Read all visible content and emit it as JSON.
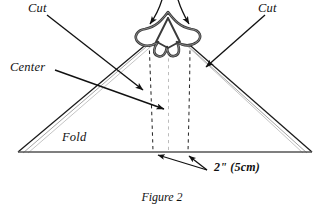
{
  "figure": {
    "caption": "Figure 2",
    "width": 324,
    "height": 204,
    "background_color": "#ffffff",
    "line_color": "#1a1a1a",
    "fold_edge_color": "#9a9a9a",
    "dashed_guide_color": "#2b2b2b",
    "center_guide_color": "#b9b9b9"
  },
  "labels": {
    "cut_left": "Cut",
    "cut_right": "Cut",
    "center": "Center",
    "fold": "Fold",
    "measurement": "2\" (5cm)"
  },
  "shapes": {
    "triangle": {
      "apex": [
        168,
        26
      ],
      "bottom_left": [
        18,
        152
      ],
      "bottom_right": [
        312,
        152
      ]
    },
    "flower": {
      "name": "trefoil-flower",
      "petals": 3,
      "center": [
        168,
        33
      ]
    },
    "dashed_guides": [
      {
        "name": "left-cut-guide",
        "top": [
          150,
          35
        ],
        "bottom": [
          153,
          152
        ]
      },
      {
        "name": "center-guide",
        "top": [
          168,
          35
        ],
        "bottom": [
          168,
          152
        ]
      },
      {
        "name": "right-cut-guide",
        "top": [
          189,
          35
        ],
        "bottom": [
          188,
          152
        ]
      }
    ]
  },
  "arrows": {
    "cut_left_pointer": {
      "from": [
        60,
        16
      ],
      "to": [
        146,
        93
      ]
    },
    "cut_right_pointer": {
      "from": [
        264,
        16
      ],
      "to": [
        203,
        70
      ]
    },
    "center_pointer": {
      "from": [
        58,
        72
      ],
      "to": [
        167,
        111
      ]
    },
    "apex_left_pointer": {
      "from": [
        162,
        0
      ],
      "to": [
        150,
        27
      ]
    },
    "apex_right_pointer": {
      "from": [
        177,
        0
      ],
      "to": [
        189,
        27
      ]
    },
    "measure_left_pointer": {
      "from": [
        208,
        168
      ],
      "to": [
        154,
        153
      ]
    },
    "measure_right_pointer": {
      "from": [
        208,
        168
      ],
      "to": [
        187,
        153
      ]
    }
  }
}
